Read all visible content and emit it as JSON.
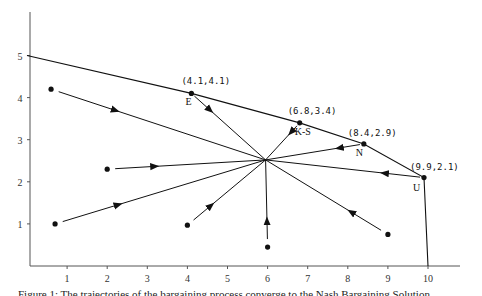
{
  "chart_data": {
    "type": "line",
    "title": "",
    "xlabel": "",
    "ylabel": "",
    "xlim": [
      0,
      11
    ],
    "ylim": [
      0,
      6
    ],
    "grid": false,
    "x_ticks": [
      "1",
      "2",
      "3",
      "4",
      "5",
      "6",
      "7",
      "8",
      "9",
      "10"
    ],
    "y_ticks": [
      "1",
      "2",
      "3",
      "4",
      "5"
    ],
    "frontier": [
      [
        0,
        5
      ],
      [
        4.1,
        4.1
      ],
      [
        6.8,
        3.4
      ],
      [
        8.4,
        2.9
      ],
      [
        9.9,
        2.1
      ],
      [
        10,
        0
      ]
    ],
    "solution_points": [
      {
        "name": "E",
        "label": "(4.1,4.1)",
        "x": 4.1,
        "y": 4.1
      },
      {
        "name": "K-S",
        "label": "(6.8,3.4)",
        "x": 6.8,
        "y": 3.4
      },
      {
        "name": "N",
        "label": "(8.4,2.9)",
        "x": 8.4,
        "y": 2.9
      },
      {
        "name": "U",
        "label": "(9.9,2.1)",
        "x": 9.9,
        "y": 2.1
      }
    ],
    "convergence_point": [
      5.95,
      2.52
    ],
    "trajectories": [
      {
        "start": [
          0.6,
          4.2
        ],
        "end": [
          5.95,
          2.52
        ]
      },
      {
        "start": [
          2.0,
          2.3
        ],
        "end": [
          5.95,
          2.52
        ]
      },
      {
        "start": [
          0.7,
          1.0
        ],
        "end": [
          5.95,
          2.52
        ]
      },
      {
        "start": [
          4.0,
          0.97
        ],
        "end": [
          5.95,
          2.52
        ]
      },
      {
        "start": [
          6.0,
          0.45
        ],
        "end": [
          5.95,
          2.52
        ]
      },
      {
        "start": [
          9.0,
          0.75
        ],
        "end": [
          5.95,
          2.52
        ]
      },
      {
        "start": [
          4.1,
          4.1
        ],
        "end": [
          5.95,
          2.52
        ]
      },
      {
        "start": [
          6.8,
          3.4
        ],
        "end": [
          5.95,
          2.52
        ]
      },
      {
        "start": [
          8.4,
          2.9
        ],
        "end": [
          5.95,
          2.52
        ]
      },
      {
        "start": [
          9.9,
          2.1
        ],
        "end": [
          5.95,
          2.52
        ]
      }
    ]
  },
  "caption": "Figure 1: The trajectories of the bargaining process converge to the Nash Bargaining Solution"
}
